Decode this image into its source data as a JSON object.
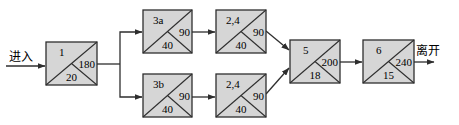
{
  "diagram": {
    "type": "activity-on-node network",
    "colors": {
      "box_fill": "#d6d6d6",
      "stroke": "#2e2e2e",
      "background": "#ffffff"
    },
    "entry_label": "进入",
    "exit_label": "离开",
    "nodes": [
      {
        "id": "1",
        "right": "180",
        "bottom": "20",
        "x": 46,
        "y": 42,
        "w": 51,
        "h": 43
      },
      {
        "id": "3a",
        "right": "90",
        "bottom": "40",
        "x": 143,
        "y": 10,
        "w": 49,
        "h": 43
      },
      {
        "id": "3b",
        "right": "90",
        "bottom": "40",
        "x": 143,
        "y": 74,
        "w": 49,
        "h": 43
      },
      {
        "id": "2,4",
        "right": "90",
        "bottom": "40",
        "x": 216,
        "y": 10,
        "w": 50,
        "h": 43
      },
      {
        "id": "2,4",
        "right": "90",
        "bottom": "40",
        "x": 216,
        "y": 74,
        "w": 50,
        "h": 43
      },
      {
        "id": "5",
        "right": "200",
        "bottom": "18",
        "x": 290,
        "y": 40,
        "w": 50,
        "h": 43
      },
      {
        "id": "6",
        "right": "240",
        "bottom": "15",
        "x": 363,
        "y": 40,
        "w": 51,
        "h": 43
      }
    ],
    "edges": [
      {
        "from": "entry",
        "to": "1"
      },
      {
        "from": "1",
        "to": "3a"
      },
      {
        "from": "1",
        "to": "3b"
      },
      {
        "from": "3a",
        "to": "2,4 (top)"
      },
      {
        "from": "3b",
        "to": "2,4 (bottom)"
      },
      {
        "from": "2,4 (top)",
        "to": "5"
      },
      {
        "from": "2,4 (bottom)",
        "to": "5"
      },
      {
        "from": "5",
        "to": "6"
      },
      {
        "from": "6",
        "to": "exit"
      }
    ]
  }
}
